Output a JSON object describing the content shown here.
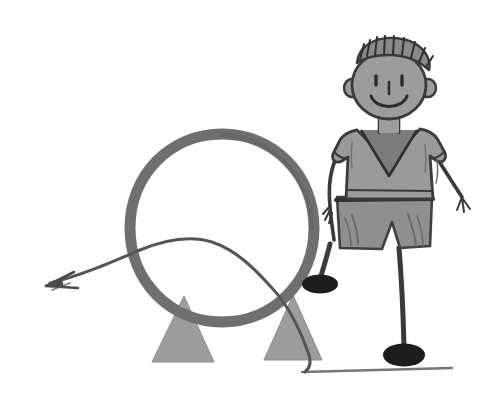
{
  "image": {
    "title": "Boy standing next to a large hoop with an arrow passing through it",
    "style": "hand-drawn grayscale cartoon line art",
    "background_color": "#ffffff",
    "width": 498,
    "height": 410
  },
  "palette": {
    "background": "#ffffff",
    "outline_dark": "#3a3a3a",
    "outline_mid": "#6d6d6d",
    "hoop_stroke": "#6f6f6f",
    "skin_fill": "#9c9c9c",
    "hair_fill": "#8a8a8a",
    "vest_fill": "#9a9a9a",
    "shorts_fill": "#8f8f8f",
    "stand_fill": "#9d9d9d",
    "shoe_fill": "#1d1d1d",
    "rope_stroke": "#555555",
    "ground_stroke": "#777777"
  },
  "objects": {
    "hoop": {
      "name": "large circular hoop",
      "center_x": 222,
      "center_y": 228,
      "radius_x": 92,
      "radius_y": 94,
      "stroke_width": 11,
      "color": "#6f6f6f"
    },
    "stands": {
      "name": "triangular hoop supports",
      "count": 2,
      "color": "#9d9d9d",
      "left": {
        "apex_x": 184,
        "apex_y": 298,
        "base_left_x": 152,
        "base_right_x": 214,
        "base_y": 362
      },
      "right": {
        "apex_x": 293,
        "apex_y": 297,
        "base_left_x": 264,
        "base_right_x": 322,
        "base_y": 360
      }
    },
    "rope": {
      "name": "rope with arrow passing through hoop",
      "color": "#555555",
      "stroke_width": 3,
      "arrow_tip_x": 46,
      "arrow_tip_y": 285,
      "direction": "points down-left"
    },
    "ground_line": {
      "name": "ground line",
      "x1": 302,
      "y1": 372,
      "x2": 452,
      "y2": 368,
      "color": "#777777"
    },
    "boy": {
      "name": "cartoon boy character",
      "head": {
        "center_x": 389,
        "center_y": 85,
        "radius_x": 36,
        "radius_y": 33
      },
      "features": [
        "spiky-hair",
        "two-eyes",
        "nose",
        "smile",
        "left-ear",
        "right-ear"
      ],
      "clothing": [
        "v-neck-vest",
        "short-sleeves",
        "shorts"
      ],
      "limbs": [
        "left-arm-down",
        "right-arm-out",
        "left-leg",
        "right-leg"
      ],
      "shoes": [
        {
          "label": "left-shoe",
          "cx": 320,
          "cy": 284,
          "rx": 17,
          "ry": 9
        },
        {
          "label": "right-shoe",
          "cx": 404,
          "cy": 355,
          "rx": 20,
          "ry": 11
        }
      ]
    }
  }
}
